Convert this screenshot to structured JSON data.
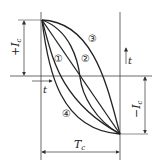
{
  "diagram": {
    "labels": {
      "plus_ic": "+I",
      "plus_ic_sub": "c",
      "minus_ic": "−I",
      "minus_ic_sub": "c",
      "t_left": "t",
      "t_right": "t",
      "tc": "T",
      "tc_sub": "c"
    },
    "curves": [
      {
        "id": "1",
        "marker": "①"
      },
      {
        "id": "2",
        "marker": "②"
      },
      {
        "id": "3",
        "marker": "③"
      },
      {
        "id": "4",
        "marker": "④"
      }
    ],
    "colors": {
      "line": "#222222",
      "thin": "#444444",
      "background": "#ffffff"
    }
  }
}
